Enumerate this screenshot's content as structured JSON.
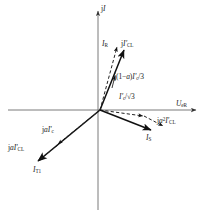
{
  "figure": {
    "type": "phasor-diagram",
    "title": "",
    "background": "#ffffff",
    "ink": "#111111",
    "axis_color": "#555555"
  },
  "axes": {
    "vertical": {
      "name": "imaginary-axis",
      "label_html": "j<i>I</i>",
      "label_text": "jI",
      "from": [
        98,
        210
      ],
      "to": [
        98,
        8
      ],
      "arrow": "up"
    },
    "horizontal": {
      "name": "real-axis",
      "label_html": "<i>U</i><sub>eR</sub>",
      "label_text": "UeR",
      "from": [
        8,
        110
      ],
      "to": [
        198,
        110
      ],
      "arrow": "right"
    },
    "origin": [
      100,
      110
    ]
  },
  "vectors": [
    {
      "id": "IR",
      "label_html": "<i>I</i><sub>R</sub>",
      "label_text": "IR",
      "style": "solid",
      "from": [
        100,
        110
      ],
      "to": [
        124,
        47
      ],
      "label_pos": [
        101,
        38
      ]
    },
    {
      "id": "jICL",
      "label_html": "j<i>I'</i><sub>CL</sub>",
      "label_text": "jI'CL",
      "style": "dashed",
      "from": [
        100,
        110
      ],
      "to": [
        117,
        44
      ],
      "label_pos": [
        120,
        38
      ]
    },
    {
      "id": "j1aIc3",
      "label_html": "j(1&minus;<i>a</i>)<i>I'</i><sub>c</sub>/3",
      "label_text": "j(1-a)I'c/3",
      "style": "annotation",
      "from": [
        117,
        70
      ],
      "to": [
        117,
        70
      ],
      "label_pos": [
        113,
        76
      ]
    },
    {
      "id": "Ic_sqrt3",
      "label_html": "<i>I'</i><sub>c</sub>/&radic;3",
      "label_text": "I'c/√3",
      "style": "dashed",
      "from": [
        100,
        110
      ],
      "to": [
        147,
        117
      ],
      "label_pos": [
        118,
        95
      ]
    },
    {
      "id": "IS",
      "label_html": "<i>I</i><sub>S</sub>",
      "label_text": "IS",
      "style": "solid",
      "from": [
        100,
        110
      ],
      "to": [
        153,
        131
      ],
      "label_pos": [
        148,
        135
      ]
    },
    {
      "id": "ja2ICL",
      "label_html": "j<i>a</i><sup>2</sup><i>I'</i><sub>CL</sub>",
      "label_text": "ja2I'CL",
      "style": "dashed",
      "from": [
        147,
        117
      ],
      "to": [
        166,
        127
      ],
      "label_pos": [
        158,
        118
      ]
    },
    {
      "id": "IT1",
      "label_html": "<i>I</i><sub>T1</sub>",
      "label_text": "IT1",
      "style": "solid",
      "from": [
        100,
        110
      ],
      "to": [
        36,
        163
      ],
      "label_pos": [
        35,
        168
      ]
    },
    {
      "id": "jaIc",
      "label_html": "j<i>a</i><i>I'</i><sub>c</sub>",
      "label_text": "jaI'c",
      "style": "dashed",
      "from": [
        100,
        110
      ],
      "to": [
        55,
        147
      ],
      "label_pos": [
        44,
        127
      ]
    },
    {
      "id": "jaICL",
      "label_html": "j<i>a</i><i>I'</i><sub>CL</sub>",
      "label_text": "jaI'CL",
      "style": "dashed",
      "from": [
        55,
        147
      ],
      "to": [
        36,
        163
      ],
      "label_pos": [
        10,
        144
      ]
    }
  ]
}
